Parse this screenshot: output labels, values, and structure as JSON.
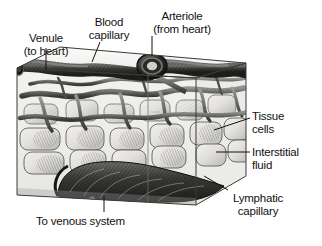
{
  "figure": {
    "type": "anatomical-illustration",
    "background_color": "#ffffff",
    "ink_color": "#111111"
  },
  "labels": {
    "venule": {
      "line1": "Venule",
      "line2": "(to heart)"
    },
    "blood_capillary": {
      "line1": "Blood",
      "line2": "capillary"
    },
    "arteriole": {
      "line1": "Arteriole",
      "line2": "(from heart)"
    },
    "tissue_cells": {
      "line1": "Tissue",
      "line2": "cells"
    },
    "interstitial_fluid": {
      "line1": "Interstitial",
      "line2": "fluid"
    },
    "lymphatic_capillary": {
      "line1": "Lymphatic",
      "line2": "capillary"
    },
    "venous_system": {
      "line1": "To venous system",
      "line2": ""
    }
  },
  "structures": [
    {
      "name": "venule",
      "description": "dark vessel entering upper-left of tissue block"
    },
    {
      "name": "blood-capillary",
      "description": "branching capillary network in mid tissue block"
    },
    {
      "name": "arteriole",
      "description": "dark vessel with circular cross-section entering top"
    },
    {
      "name": "tissue-cells",
      "description": "rounded rectangular shaded cells filling the block"
    },
    {
      "name": "interstitial-fluid",
      "description": "pale space between cells and vessels"
    },
    {
      "name": "lymphatic-capillary",
      "description": "large blind-ended dark vessel along the block floor"
    },
    {
      "name": "tissue-block",
      "description": "3D rectangular block of tissue shown in perspective"
    }
  ]
}
